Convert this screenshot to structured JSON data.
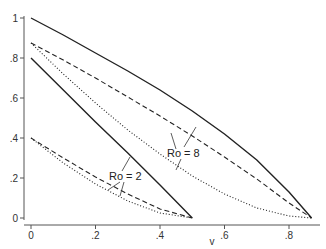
{
  "chart_data": {
    "type": "line",
    "title": "",
    "xlabel": "v",
    "ylabel": "",
    "xlim": [
      0,
      0.9
    ],
    "ylim": [
      0,
      1
    ],
    "grid": false,
    "legend": "none",
    "x_ticks": [
      "0",
      ".2",
      ".4",
      ".6",
      ".8"
    ],
    "x_tick_values": [
      0,
      0.2,
      0.4,
      0.6,
      0.8
    ],
    "y_ticks": [
      "0",
      ".2",
      ".4",
      ".6",
      ".8",
      "1"
    ],
    "y_tick_values": [
      0,
      0.2,
      0.4,
      0.6,
      0.8,
      1.0
    ],
    "annotations": [
      {
        "text": "Ro = 2",
        "x": 0.27,
        "y": 0.31
      },
      {
        "text": "Ro = 8",
        "x": 0.56,
        "y": 0.42
      }
    ],
    "series": [
      {
        "name": "Ro=8 solid",
        "style": "solid",
        "x": [
          0,
          0.1,
          0.2,
          0.3,
          0.4,
          0.5,
          0.6,
          0.7,
          0.8,
          0.87
        ],
        "y": [
          1.0,
          0.915,
          0.825,
          0.735,
          0.64,
          0.535,
          0.42,
          0.29,
          0.13,
          0.0
        ]
      },
      {
        "name": "Ro=8 dashed",
        "style": "dashed",
        "x": [
          0,
          0.1,
          0.2,
          0.3,
          0.4,
          0.5,
          0.6,
          0.7,
          0.8,
          0.87
        ],
        "y": [
          0.875,
          0.79,
          0.7,
          0.605,
          0.51,
          0.41,
          0.305,
          0.195,
          0.075,
          0.0
        ]
      },
      {
        "name": "Ro=8 dotted",
        "style": "dotted",
        "x": [
          0,
          0.1,
          0.2,
          0.3,
          0.4,
          0.5,
          0.6,
          0.7,
          0.8,
          0.87
        ],
        "y": [
          0.875,
          0.72,
          0.575,
          0.44,
          0.32,
          0.21,
          0.12,
          0.05,
          0.01,
          0.0
        ]
      },
      {
        "name": "Ro=2 solid",
        "style": "solid",
        "x": [
          0,
          0.1,
          0.2,
          0.3,
          0.4,
          0.5
        ],
        "y": [
          0.8,
          0.64,
          0.48,
          0.325,
          0.165,
          0.0
        ]
      },
      {
        "name": "Ro=2 dashed",
        "style": "dashed",
        "x": [
          0,
          0.1,
          0.2,
          0.3,
          0.4,
          0.5
        ],
        "y": [
          0.4,
          0.3,
          0.205,
          0.12,
          0.045,
          0.0
        ]
      },
      {
        "name": "Ro=2 dotted",
        "style": "dotted",
        "x": [
          0,
          0.1,
          0.2,
          0.3,
          0.4,
          0.5
        ],
        "y": [
          0.4,
          0.275,
          0.17,
          0.085,
          0.025,
          0.0
        ]
      }
    ]
  },
  "plot": {
    "left_px": 31,
    "bottom_px": 218,
    "x_scale": 322.5,
    "y_scale": 200,
    "axis_color": "#555555",
    "line_color": "#222222"
  }
}
